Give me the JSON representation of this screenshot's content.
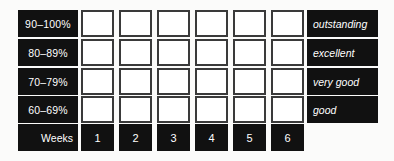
{
  "chart_data": {
    "type": "table",
    "title": "",
    "xlabel": "Weeks",
    "ylabel": "",
    "grid": true,
    "categories": [
      "1",
      "2",
      "3",
      "4",
      "5",
      "6"
    ],
    "rows": [
      {
        "band": "90–100%",
        "descriptor": "outstanding",
        "marks": [
          false,
          false,
          false,
          false,
          false,
          false
        ]
      },
      {
        "band": "80–89%",
        "descriptor": "excellent",
        "marks": [
          false,
          false,
          false,
          false,
          false,
          false
        ]
      },
      {
        "band": "70–79%",
        "descriptor": "very good",
        "marks": [
          false,
          false,
          false,
          false,
          false,
          false
        ]
      },
      {
        "band": "60–69%",
        "descriptor": "good",
        "marks": [
          false,
          false,
          false,
          false,
          false,
          false
        ]
      }
    ],
    "colors": {
      "chip_background": "#111111",
      "chip_text": "#ffffff",
      "cell_fill": "#ffffff",
      "cell_border": "#3a3a3a",
      "page_background": "#fbfbfa"
    }
  },
  "tracker": {
    "weeks_caption": "Weeks",
    "week_numbers": [
      "1",
      "2",
      "3",
      "4",
      "5",
      "6"
    ],
    "bands": [
      {
        "range": "90–100%",
        "descriptor": "outstanding"
      },
      {
        "range": "80–89%",
        "descriptor": "excellent"
      },
      {
        "range": "70–79%",
        "descriptor": "very good"
      },
      {
        "range": "60–69%",
        "descriptor": "good"
      }
    ]
  }
}
